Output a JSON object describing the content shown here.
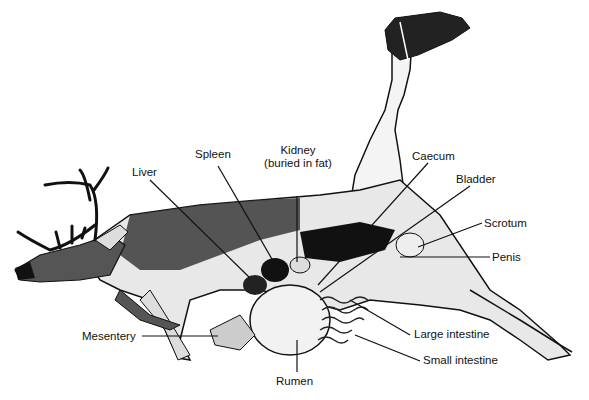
{
  "diagram": {
    "labels": {
      "spleen": "Spleen",
      "kidney_line1": "Kidney",
      "kidney_line2": "(buried in fat)",
      "caecum": "Caecum",
      "liver": "Liver",
      "bladder": "Bladder",
      "scrotum": "Scrotum",
      "penis": "Penis",
      "mesentery": "Mesentery",
      "large_intestine": "Large intestine",
      "small_intestine": "Small intestine",
      "rumen": "Rumen"
    },
    "colors": {
      "ink": "#111111",
      "background": "#ffffff"
    }
  }
}
